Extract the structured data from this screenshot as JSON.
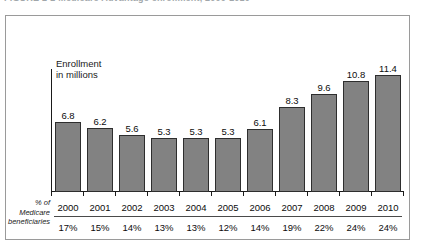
{
  "caption": {
    "text": "FIGURE 2-2    Medicare Advantage enrollment, 2000-2010"
  },
  "chart_data": {
    "type": "bar",
    "title": "",
    "subtitle": "",
    "xlabel": "",
    "ylabel": "Enrollment in millions",
    "ylim": [
      0,
      12
    ],
    "grid": false,
    "legend": "none",
    "categories": [
      "2000",
      "2001",
      "2002",
      "2003",
      "2004",
      "2005",
      "2006",
      "2007",
      "2008",
      "2009",
      "2010"
    ],
    "values": [
      6.8,
      6.2,
      5.6,
      5.3,
      5.3,
      5.3,
      6.1,
      8.3,
      9.6,
      10.8,
      11.4
    ],
    "value_labels": [
      "6.8",
      "6.2",
      "5.6",
      "5.3",
      "5.3",
      "5.3",
      "6.1",
      "8.3",
      "9.6",
      "10.8",
      "11.4"
    ],
    "bar_color": "#828282",
    "bar_border_color": "#2e2e2e",
    "secondary_row": {
      "label": "% of Medicare beneficiaries",
      "label_lines": [
        "% of",
        "Medicare",
        "beneficiaries"
      ],
      "values": [
        "17%",
        "15%",
        "14%",
        "13%",
        "13%",
        "12%",
        "14%",
        "19%",
        "22%",
        "24%",
        "24%"
      ]
    }
  },
  "axis": {
    "y_label_line1": "Enrollment",
    "y_label_line2": "in millions"
  }
}
